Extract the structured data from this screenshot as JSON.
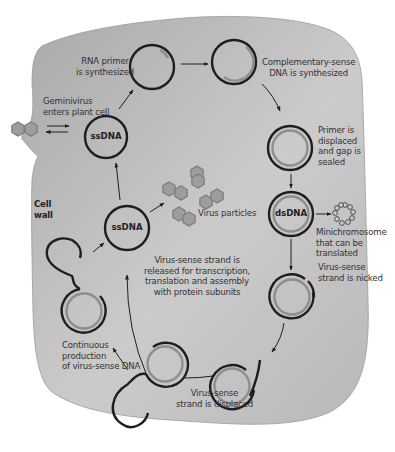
{
  "colors": {
    "cell_fill": "#b9b9b9",
    "background": "#ffffff",
    "strand_dark": "#1e1e1e",
    "strand_light": "#8e8e8e",
    "virus_particle": "#9d9d9d",
    "text": "#333333"
  },
  "labels": {
    "cell_wall": "Cell\nwall",
    "entry": "Geminivirus\nenters plant cell",
    "rna_primer": "RNA primer\nis synthesized",
    "complementary": "Complementary-sense\nDNA is synthesized",
    "primer_displaced": "Primer is\ndisplaced\nand gap is\nsealed",
    "minichromosome": "Minichromosome\nthat can be\ntranslated",
    "nicked": "Virus-sense\nstrand is nicked",
    "displaced": "Virus-sense\nstrand is displaced",
    "continuous": "Continuous\nproduction\nof virus-sense DNA",
    "released": "Virus-sense strand is\nreleased for transcription,\ntranslation and assembly\nwith protein subunits",
    "virus_particles": "Virus particles"
  },
  "circles": {
    "ssdna_top": "ssDNA",
    "ssdna_center": "ssDNA",
    "dsdna": "dsDNA"
  },
  "icons": {
    "virus_particle": "hexagon-icon",
    "minichromosome": "bead-ring-icon",
    "arrow": "arrow-icon"
  }
}
